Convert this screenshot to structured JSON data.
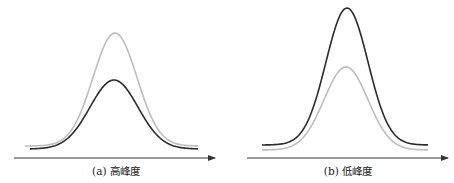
{
  "figure": {
    "panels": [
      {
        "id": "a",
        "caption": "(a) 高峰度",
        "axis": {
          "x1": 14,
          "x2": 215,
          "y": 158
        },
        "curves": [
          {
            "name": "reference-curve",
            "color": "#bdbdbd",
            "width": 1.6,
            "x0": 25,
            "x1": 198,
            "center": 115,
            "sigma": 22,
            "base_y": 146,
            "peak_y": 33
          },
          {
            "name": "sample-curve",
            "color": "#2b2b2b",
            "width": 1.6,
            "x0": 30,
            "x1": 198,
            "center": 114,
            "sigma": 24,
            "base_y": 149,
            "peak_y": 80
          }
        ]
      },
      {
        "id": "b",
        "caption": "(b) 低峰度",
        "axis": {
          "x1": 247,
          "x2": 448,
          "y": 158
        },
        "curves": [
          {
            "name": "reference-curve",
            "color": "#bdbdbd",
            "width": 1.6,
            "x0": 262,
            "x1": 428,
            "center": 346,
            "sigma": 22,
            "base_y": 150,
            "peak_y": 67
          },
          {
            "name": "sample-curve",
            "color": "#2b2b2b",
            "width": 1.6,
            "x0": 262,
            "x1": 428,
            "center": 347,
            "sigma": 21,
            "base_y": 145,
            "peak_y": 8
          }
        ]
      }
    ],
    "colors": {
      "axis": "#333333",
      "dark_curve": "#2b2b2b",
      "light_curve": "#bdbdbd"
    }
  }
}
